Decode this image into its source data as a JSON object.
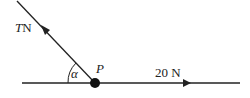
{
  "diagram": {
    "type": "force-diagram",
    "point": {
      "label": "P",
      "x": 95,
      "y": 83
    },
    "angle": {
      "label": "α"
    },
    "forces": [
      {
        "id": "tension",
        "label_var": "T",
        "label_unit": "N",
        "direction": "up-left along inclined line"
      },
      {
        "id": "horizontal",
        "label": "20 N",
        "direction": "right along horizontal line"
      }
    ],
    "colors": {
      "line": "#222222",
      "background": "#ffffff"
    }
  }
}
